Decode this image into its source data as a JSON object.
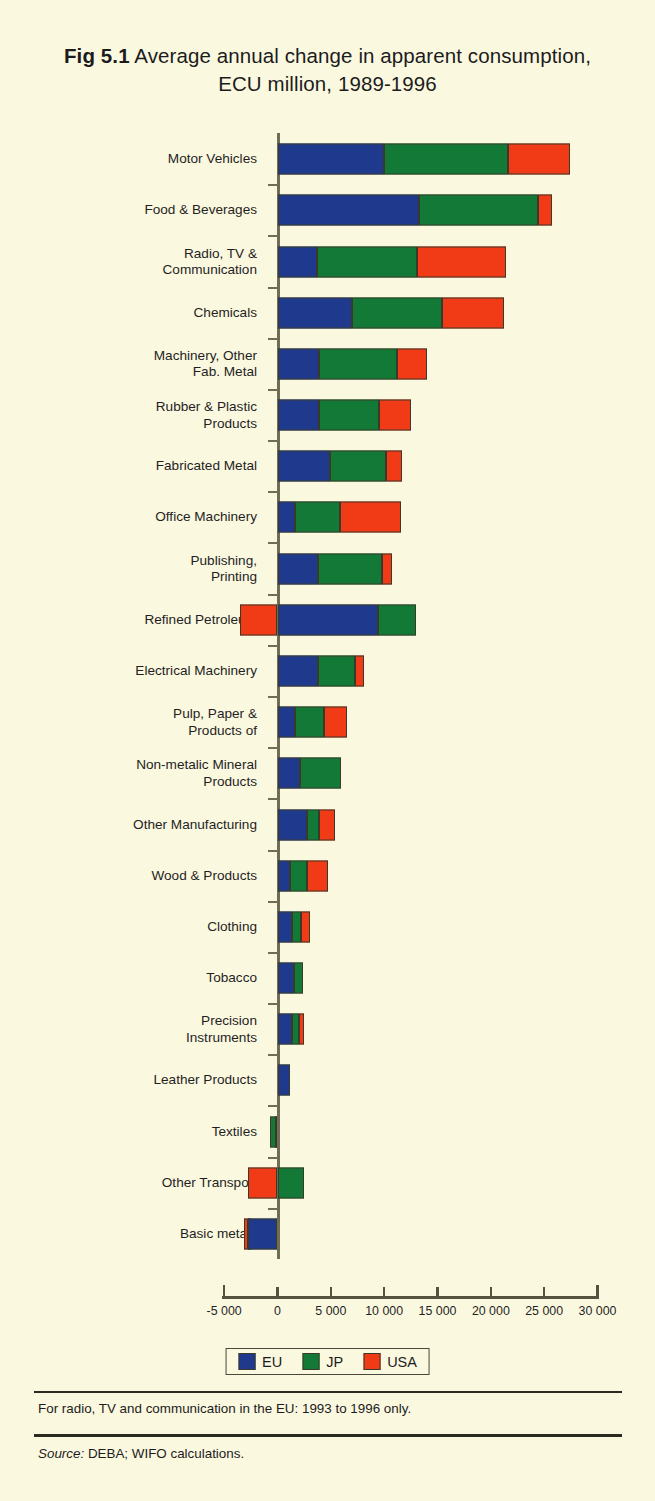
{
  "title": {
    "figure_number": "Fig 5.1",
    "text": " Average annual change in apparent consumption, ECU million, 1989-1996"
  },
  "legend": {
    "items": [
      {
        "label": "EU",
        "color": "#1f3a8c"
      },
      {
        "label": "JP",
        "color": "#127a36"
      },
      {
        "label": "USA",
        "color": "#f03b16"
      }
    ]
  },
  "footnotes": {
    "note": "For radio, TV and communication in the EU: 1993 to 1996 only.",
    "source_label": "Source:",
    "source_text": " DEBA; WIFO calculations."
  },
  "chart_data": {
    "type": "bar",
    "orientation": "horizontal",
    "stacked": true,
    "title": "Fig 5.1 Average annual change in apparent consumption, ECU million, 1989-1996",
    "xlabel": "",
    "ylabel": "",
    "xlim": [
      -5000,
      30000
    ],
    "xticks": [
      -5000,
      0,
      5000,
      10000,
      15000,
      20000,
      25000,
      30000
    ],
    "xtick_labels": [
      "-5 000",
      "0",
      "5 000",
      "10 000",
      "15 000",
      "20 000",
      "25 000",
      "30 000"
    ],
    "grid": false,
    "legend_position": "bottom",
    "categories": [
      "Motor Vehicles",
      "Food & Beverages",
      "Radio, TV &\nCommunication",
      "Chemicals",
      "Machinery, Other\nFab. Metal",
      "Rubber & Plastic\nProducts",
      "Fabricated Metal",
      "Office Machinery",
      "Publishing,\nPrinting",
      "Refined Petroleum",
      "Electrical Machinery",
      "Pulp, Paper &\nProducts of",
      "Non-metalic Mineral\nProducts",
      "Other Manufacturing",
      "Wood & Products",
      "Clothing",
      "Tobacco",
      "Precision\nInstruments",
      "Leather  Products",
      "Textiles",
      "Other Transport",
      "Basic metals"
    ],
    "series": [
      {
        "name": "EU",
        "color": "#1f3a8c",
        "values": [
          10000,
          13300,
          3700,
          7000,
          3900,
          3900,
          4900,
          1600,
          3800,
          9400,
          3800,
          1600,
          2100,
          2800,
          1200,
          1400,
          1500,
          1400,
          1200,
          200,
          0,
          -2800
        ]
      },
      {
        "name": "JP",
        "color": "#127a36",
        "values": [
          11600,
          11100,
          9400,
          8400,
          7300,
          5600,
          5300,
          4300,
          6000,
          3600,
          3500,
          2800,
          3900,
          1100,
          1600,
          800,
          900,
          650,
          0,
          -700,
          2500,
          -300
        ]
      },
      {
        "name": "USA",
        "color": "#f03b16",
        "values": [
          5800,
          1300,
          8300,
          5800,
          2800,
          3000,
          1500,
          5700,
          900,
          -3500,
          850,
          2150,
          0,
          1500,
          1900,
          850,
          0,
          450,
          0,
          0,
          -2800,
          -300
        ]
      }
    ],
    "totals_note": "Bars are stacked left-to-right in order EU, JP, USA; negative values extend left of zero."
  },
  "bars": [
    {
      "name": "Motor Vehicles",
      "segs": [
        {
          "s": "eu",
          "x0": 0,
          "x1": 10000
        },
        {
          "s": "jp",
          "x0": 10000,
          "x1": 21600
        },
        {
          "s": "usa",
          "x0": 21600,
          "x1": 27400
        }
      ]
    },
    {
      "name": "Food & Beverages",
      "segs": [
        {
          "s": "eu",
          "x0": 0,
          "x1": 13300
        },
        {
          "s": "jp",
          "x0": 13300,
          "x1": 24400
        },
        {
          "s": "usa",
          "x0": 24400,
          "x1": 25700
        }
      ]
    },
    {
      "name": "Radio, TV & Communication",
      "segs": [
        {
          "s": "eu",
          "x0": 0,
          "x1": 3700
        },
        {
          "s": "jp",
          "x0": 3700,
          "x1": 13100
        },
        {
          "s": "usa",
          "x0": 13100,
          "x1": 21400
        }
      ]
    },
    {
      "name": "Chemicals",
      "segs": [
        {
          "s": "eu",
          "x0": 0,
          "x1": 7000
        },
        {
          "s": "jp",
          "x0": 7000,
          "x1": 15400
        },
        {
          "s": "usa",
          "x0": 15400,
          "x1": 21200
        }
      ]
    },
    {
      "name": "Machinery, Other Fab. Metal",
      "segs": [
        {
          "s": "eu",
          "x0": 0,
          "x1": 3900
        },
        {
          "s": "jp",
          "x0": 3900,
          "x1": 11200
        },
        {
          "s": "usa",
          "x0": 11200,
          "x1": 14000
        }
      ]
    },
    {
      "name": "Rubber & Plastic Products",
      "segs": [
        {
          "s": "eu",
          "x0": 0,
          "x1": 3900
        },
        {
          "s": "jp",
          "x0": 3900,
          "x1": 9500
        },
        {
          "s": "usa",
          "x0": 9500,
          "x1": 12500
        }
      ]
    },
    {
      "name": "Fabricated Metal",
      "segs": [
        {
          "s": "eu",
          "x0": 0,
          "x1": 4900
        },
        {
          "s": "jp",
          "x0": 4900,
          "x1": 10200
        },
        {
          "s": "usa",
          "x0": 10200,
          "x1": 11700
        }
      ]
    },
    {
      "name": "Office Machinery",
      "segs": [
        {
          "s": "eu",
          "x0": 0,
          "x1": 1600
        },
        {
          "s": "jp",
          "x0": 1600,
          "x1": 5900
        },
        {
          "s": "usa",
          "x0": 5900,
          "x1": 11600
        }
      ]
    },
    {
      "name": "Publishing, Printing",
      "segs": [
        {
          "s": "eu",
          "x0": 0,
          "x1": 3800
        },
        {
          "s": "jp",
          "x0": 3800,
          "x1": 9800
        },
        {
          "s": "usa",
          "x0": 9800,
          "x1": 10700
        }
      ]
    },
    {
      "name": "Refined Petroleum",
      "segs": [
        {
          "s": "usa",
          "x0": -3500,
          "x1": 0
        },
        {
          "s": "eu",
          "x0": 0,
          "x1": 9400
        },
        {
          "s": "jp",
          "x0": 9400,
          "x1": 13000
        }
      ]
    },
    {
      "name": "Electrical Machinery",
      "segs": [
        {
          "s": "eu",
          "x0": 0,
          "x1": 3800
        },
        {
          "s": "jp",
          "x0": 3800,
          "x1": 7300
        },
        {
          "s": "usa",
          "x0": 7300,
          "x1": 8150
        }
      ]
    },
    {
      "name": "Pulp, Paper & Products of",
      "segs": [
        {
          "s": "eu",
          "x0": 0,
          "x1": 1600
        },
        {
          "s": "jp",
          "x0": 1600,
          "x1": 4400
        },
        {
          "s": "usa",
          "x0": 4400,
          "x1": 6550
        }
      ]
    },
    {
      "name": "Non-metalic Mineral Products",
      "segs": [
        {
          "s": "eu",
          "x0": 0,
          "x1": 2100
        },
        {
          "s": "jp",
          "x0": 2100,
          "x1": 6000
        }
      ]
    },
    {
      "name": "Other Manufacturing",
      "segs": [
        {
          "s": "eu",
          "x0": 0,
          "x1": 2800
        },
        {
          "s": "jp",
          "x0": 2800,
          "x1": 3900
        },
        {
          "s": "usa",
          "x0": 3900,
          "x1": 5400
        }
      ]
    },
    {
      "name": "Wood & Products",
      "segs": [
        {
          "s": "eu",
          "x0": 0,
          "x1": 1200
        },
        {
          "s": "jp",
          "x0": 1200,
          "x1": 2800
        },
        {
          "s": "usa",
          "x0": 2800,
          "x1": 4700
        }
      ]
    },
    {
      "name": "Clothing",
      "segs": [
        {
          "s": "eu",
          "x0": 0,
          "x1": 1400
        },
        {
          "s": "jp",
          "x0": 1400,
          "x1": 2200
        },
        {
          "s": "usa",
          "x0": 2200,
          "x1": 3050
        }
      ]
    },
    {
      "name": "Tobacco",
      "segs": [
        {
          "s": "eu",
          "x0": 0,
          "x1": 1500
        },
        {
          "s": "jp",
          "x0": 1500,
          "x1": 2400
        }
      ]
    },
    {
      "name": "Precision Instruments",
      "segs": [
        {
          "s": "eu",
          "x0": 0,
          "x1": 1400
        },
        {
          "s": "jp",
          "x0": 1400,
          "x1": 2050
        },
        {
          "s": "usa",
          "x0": 2050,
          "x1": 2500
        }
      ]
    },
    {
      "name": "Leather  Products",
      "segs": [
        {
          "s": "eu",
          "x0": 0,
          "x1": 1200
        }
      ]
    },
    {
      "name": "Textiles",
      "segs": [
        {
          "s": "jp",
          "x0": -700,
          "x1": 0
        },
        {
          "s": "eu",
          "x0": -200,
          "x1": 0
        }
      ]
    },
    {
      "name": "Other Transport",
      "segs": [
        {
          "s": "usa",
          "x0": -2800,
          "x1": 0
        },
        {
          "s": "jp",
          "x0": 0,
          "x1": 2500
        }
      ]
    },
    {
      "name": "Basic metals",
      "segs": [
        {
          "s": "usa",
          "x0": -3100,
          "x1": -2800
        },
        {
          "s": "jp",
          "x0": -2800,
          "x1": -2500
        },
        {
          "s": "eu",
          "x0": -2800,
          "x1": 0
        }
      ]
    }
  ]
}
